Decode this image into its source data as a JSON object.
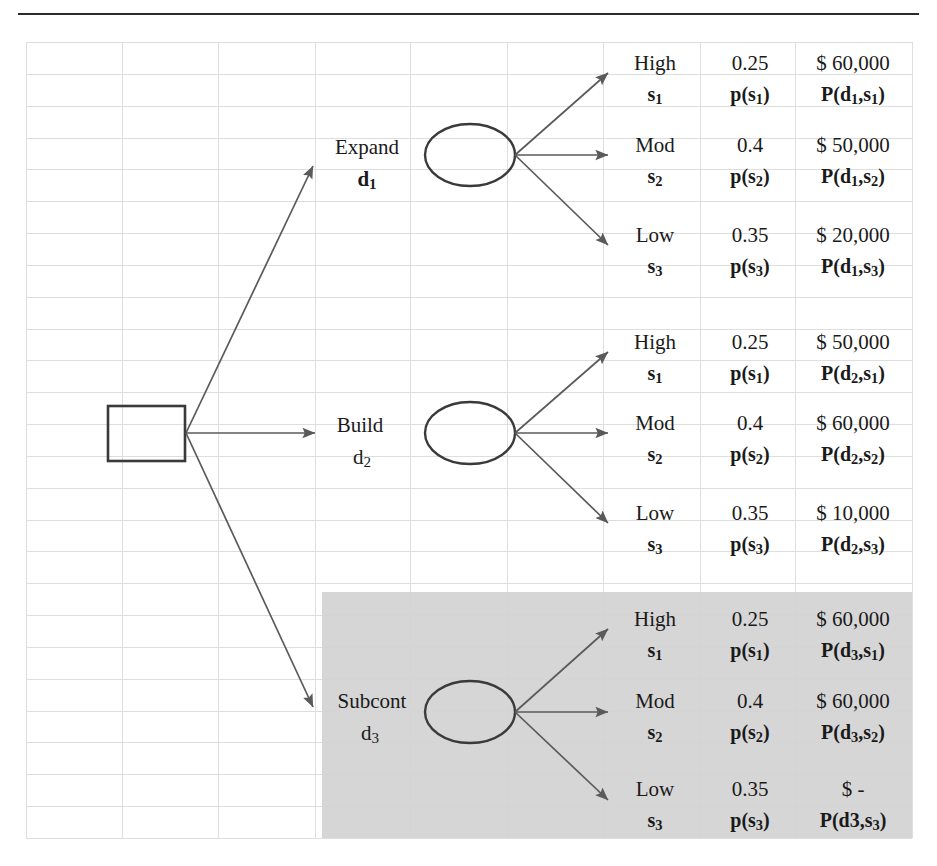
{
  "diagram": {
    "type": "decision-tree",
    "title_rule": true,
    "root": {
      "shape": "square",
      "label": ""
    },
    "columns": {
      "state_header": "state",
      "probability_header": "probability",
      "payoff_header": "payoff"
    },
    "branches": [
      {
        "decision_label": "Expand",
        "decision_id": "d",
        "decision_sub": "1",
        "shaded": false,
        "chance_node": "ellipse",
        "outcomes": [
          {
            "state": "High",
            "state_id": "s",
            "state_sub": "1",
            "probability": "0.25",
            "prob_id": "p(s",
            "prob_sub": "1",
            "prob_id_end": ")",
            "payoff": "$ 60,000",
            "payoff_id": "P(d",
            "payoff_sub_d": "1",
            "payoff_mid": ",s",
            "payoff_sub_s": "1",
            "payoff_id_end": ")"
          },
          {
            "state": "Mod",
            "state_id": "s",
            "state_sub": "2",
            "probability": "0.4",
            "prob_id": "p(s",
            "prob_sub": "2",
            "prob_id_end": ")",
            "payoff": "$ 50,000",
            "payoff_id": "P(d",
            "payoff_sub_d": "1",
            "payoff_mid": ",s",
            "payoff_sub_s": "2",
            "payoff_id_end": ")"
          },
          {
            "state": "Low",
            "state_id": "s",
            "state_sub": "3",
            "probability": "0.35",
            "prob_id": "p(s",
            "prob_sub": "3",
            "prob_id_end": ")",
            "payoff": "$ 20,000",
            "payoff_id": "P(d",
            "payoff_sub_d": "1",
            "payoff_mid": ",s",
            "payoff_sub_s": "3",
            "payoff_id_end": ")"
          }
        ]
      },
      {
        "decision_label": "Build",
        "decision_id": "d",
        "decision_sub": "2",
        "shaded": false,
        "chance_node": "ellipse",
        "outcomes": [
          {
            "state": "High",
            "state_id": "s",
            "state_sub": "1",
            "probability": "0.25",
            "prob_id": "p(s",
            "prob_sub": "1",
            "prob_id_end": ")",
            "payoff": "$ 50,000",
            "payoff_id": "P(d",
            "payoff_sub_d": "2",
            "payoff_mid": ",s",
            "payoff_sub_s": "1",
            "payoff_id_end": ")"
          },
          {
            "state": "Mod",
            "state_id": "s",
            "state_sub": "2",
            "probability": "0.4",
            "prob_id": "p(s",
            "prob_sub": "2",
            "prob_id_end": ")",
            "payoff": "$ 60,000",
            "payoff_id": "P(d",
            "payoff_sub_d": "2",
            "payoff_mid": ",s",
            "payoff_sub_s": "2",
            "payoff_id_end": ")"
          },
          {
            "state": "Low",
            "state_id": "s",
            "state_sub": "3",
            "probability": "0.35",
            "prob_id": "p(s",
            "prob_sub": "3",
            "prob_id_end": ")",
            "payoff": "$ 10,000",
            "payoff_id": "P(d",
            "payoff_sub_d": "2",
            "payoff_mid": ",s",
            "payoff_sub_s": "3",
            "payoff_id_end": ")"
          }
        ]
      },
      {
        "decision_label": "Subcont",
        "decision_id": "d",
        "decision_sub": "3",
        "shaded": true,
        "chance_node": "ellipse",
        "outcomes": [
          {
            "state": "High",
            "state_id": "s",
            "state_sub": "1",
            "probability": "0.25",
            "prob_id": "p(s",
            "prob_sub": "1",
            "prob_id_end": ")",
            "payoff": "$ 60,000",
            "payoff_id": "P(d",
            "payoff_sub_d": "3",
            "payoff_mid": ",s",
            "payoff_sub_s": "1",
            "payoff_id_end": ")"
          },
          {
            "state": "Mod",
            "state_id": "s",
            "state_sub": "2",
            "probability": "0.4",
            "prob_id": "p(s",
            "prob_sub": "2",
            "prob_id_end": ")",
            "payoff": "$ 60,000",
            "payoff_id": "P(d",
            "payoff_sub_d": "3",
            "payoff_mid": ",s",
            "payoff_sub_s": "2",
            "payoff_id_end": ")"
          },
          {
            "state": "Low",
            "state_id": "s",
            "state_sub": "3",
            "probability": "0.35",
            "prob_id": "p(s",
            "prob_sub": "3",
            "prob_id_end": ")",
            "payoff": "$          -",
            "payoff_id": "P(d3,s",
            "payoff_sub_d": "",
            "payoff_mid": "",
            "payoff_sub_s": "3",
            "payoff_id_end": ")"
          }
        ]
      }
    ],
    "colors": {
      "rule": "#2b2b2b",
      "grid": "#dedede",
      "shade": "#d3d3d3",
      "node_stroke": "#3a3a3a",
      "arrow": "#5a5a5a",
      "text": "#1a1a1a"
    }
  }
}
